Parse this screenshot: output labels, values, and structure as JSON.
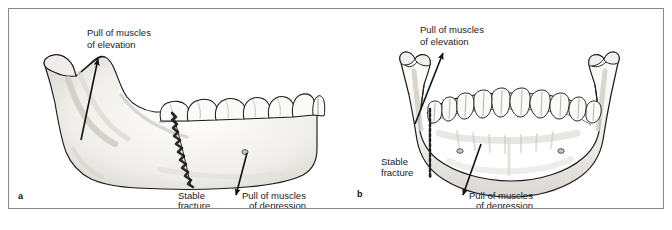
{
  "figure": {
    "type": "medical-illustration",
    "panels": [
      {
        "id": "a",
        "letter": "a",
        "view": "lateral",
        "labels": {
          "elevation_line1": "Pull of muscles",
          "elevation_line2": "of elevation",
          "fracture_line1": "Stable",
          "fracture_line2": "fracture",
          "depression_line1": "Pull of muscles",
          "depression_line2": "of depression"
        }
      },
      {
        "id": "b",
        "letter": "b",
        "view": "frontal",
        "labels": {
          "elevation_line1": "Pull of muscles",
          "elevation_line2": "of elevation",
          "fracture_line1": "Stable",
          "fracture_line2": "fracture",
          "depression_line1": "Pull of muscles",
          "depression_line2": "of depression"
        }
      }
    ]
  },
  "caption": {
    "text": ""
  },
  "colors": {
    "frame_border": "#8a8a8a",
    "bone_outline": "#1a1a1a",
    "bone_fill": "#fbfbfa",
    "bone_shade": "#d8d6d2",
    "arrow": "#111111",
    "label_text": "#1a1a1a",
    "background": "#ffffff"
  }
}
